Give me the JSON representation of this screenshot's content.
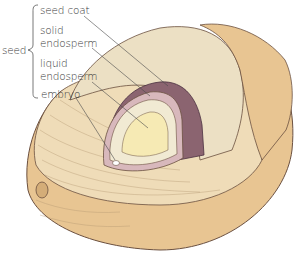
{
  "diagram": {
    "group_label": "seed",
    "labels": [
      {
        "id": "seed_coat",
        "text": "seed coat"
      },
      {
        "id": "solid_endosperm_1",
        "text": "solid"
      },
      {
        "id": "solid_endosperm_2",
        "text": "endosperm"
      },
      {
        "id": "liquid_endosperm_1",
        "text": "liquid"
      },
      {
        "id": "liquid_endosperm_2",
        "text": "endosperm"
      },
      {
        "id": "embryo",
        "text": "embryo"
      }
    ],
    "colors": {
      "husk": "#e8c592",
      "husk_light": "#f0dcb6",
      "fiber": "#efdcb8",
      "seed_coat": "#8b6470",
      "seed_coat_rim": "#d8b8bc",
      "solid_endosperm": "#f1ead3",
      "liquid_endosperm": "#f6eab4",
      "stipple": "#ece0c4",
      "outline": "#6b5040",
      "leader": "#4a4a4a"
    }
  }
}
